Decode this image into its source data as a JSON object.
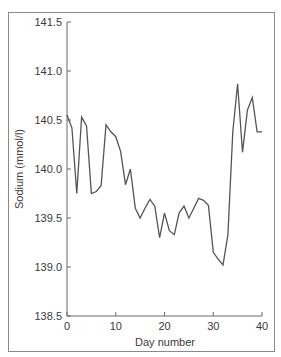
{
  "chart_data": {
    "type": "line",
    "title": "",
    "xlabel": "Day number",
    "ylabel": "Sodium (mmol/l)",
    "xlim": [
      0,
      40
    ],
    "ylim": [
      138.5,
      141.5
    ],
    "x_ticks": [
      "0",
      "10",
      "20",
      "30",
      "40"
    ],
    "y_ticks": [
      "138.5",
      "139.0",
      "139.5",
      "140.0",
      "140.5",
      "141.0",
      "141.5"
    ],
    "grid": false,
    "legend": null,
    "series": [
      {
        "name": "Sodium",
        "color": "#555555",
        "x": [
          0,
          1,
          2,
          3,
          4,
          5,
          6,
          7,
          8,
          9,
          10,
          11,
          12,
          13,
          14,
          15,
          16,
          17,
          18,
          19,
          20,
          21,
          22,
          23,
          24,
          25,
          26,
          27,
          28,
          29,
          30,
          31,
          32,
          33,
          34,
          35,
          36,
          37,
          38,
          39,
          40
        ],
        "values": [
          140.55,
          140.42,
          139.75,
          140.53,
          140.44,
          139.75,
          139.77,
          139.83,
          140.45,
          140.38,
          140.33,
          140.18,
          139.84,
          140.0,
          139.6,
          139.5,
          139.6,
          139.69,
          139.62,
          139.3,
          139.55,
          139.37,
          139.33,
          139.55,
          139.62,
          139.5,
          139.6,
          139.7,
          139.68,
          139.63,
          139.15,
          139.08,
          139.02,
          139.33,
          140.38,
          140.87,
          140.17,
          140.6,
          140.73,
          140.38,
          140.38
        ]
      }
    ]
  }
}
